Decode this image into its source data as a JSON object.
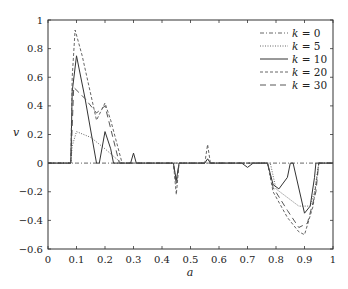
{
  "chart_data": {
    "type": "line",
    "title": "",
    "xlabel": "a",
    "ylabel": "v",
    "xlim": [
      0,
      1
    ],
    "ylim": [
      -0.6,
      1
    ],
    "grid": false,
    "legend_position": "upper right",
    "x_ticks": [
      "0",
      "0.1",
      "0.2",
      "0.3",
      "0.4",
      "0.5",
      "0.6",
      "0.7",
      "0.8",
      "0.9",
      "1"
    ],
    "y_ticks": [
      "-0.6",
      "-0.4",
      "-0.2",
      "0",
      "0.2",
      "0.4",
      "0.6",
      "0.8",
      "1"
    ],
    "series": [
      {
        "name": "k = 0",
        "style": "dashdot",
        "x": [
          0,
          0.08,
          0.09,
          0.1,
          0.5,
          0.9,
          0.95,
          1
        ],
        "y": [
          0,
          0,
          0,
          0,
          0,
          0,
          0,
          0
        ]
      },
      {
        "name": "k = 5",
        "style": "dotted",
        "x": [
          0,
          0.08,
          0.085,
          0.1,
          0.15,
          0.2,
          0.24,
          0.26,
          0.5,
          0.78,
          0.8,
          0.84,
          0.88,
          0.92,
          0.935,
          0.95,
          1
        ],
        "y": [
          0,
          0,
          0.12,
          0.22,
          0.18,
          0.1,
          0.03,
          0,
          0,
          0,
          -0.18,
          -0.24,
          -0.3,
          -0.3,
          -0.2,
          0,
          0
        ]
      },
      {
        "name": "k = 10",
        "style": "solid",
        "x": [
          0,
          0.08,
          0.085,
          0.1,
          0.13,
          0.17,
          0.18,
          0.2,
          0.22,
          0.23,
          0.29,
          0.3,
          0.31,
          0.44,
          0.45,
          0.46,
          0.55,
          0.56,
          0.57,
          0.68,
          0.7,
          0.72,
          0.77,
          0.79,
          0.81,
          0.84,
          0.85,
          0.86,
          0.9,
          0.92,
          0.935,
          0.94,
          1
        ],
        "y": [
          0,
          0,
          0.5,
          0.75,
          0.45,
          0,
          0,
          0.22,
          0.1,
          0,
          0,
          0.07,
          0,
          0,
          -0.12,
          0,
          0,
          0.03,
          0,
          0,
          -0.03,
          0,
          0,
          -0.15,
          -0.18,
          -0.1,
          0,
          0,
          -0.35,
          -0.3,
          -0.1,
          0,
          0
        ]
      },
      {
        "name": "k = 20",
        "style": "dashed",
        "x": [
          0,
          0.08,
          0.085,
          0.095,
          0.12,
          0.17,
          0.2,
          0.22,
          0.26,
          0.44,
          0.45,
          0.46,
          0.55,
          0.56,
          0.57,
          0.77,
          0.79,
          0.84,
          0.88,
          0.9,
          0.93,
          0.95,
          1
        ],
        "y": [
          0,
          0,
          0.6,
          0.93,
          0.75,
          0.3,
          0.42,
          0.3,
          0,
          0,
          -0.22,
          0,
          0,
          0.13,
          0,
          0,
          -0.2,
          -0.38,
          -0.48,
          -0.5,
          -0.3,
          0,
          0
        ]
      },
      {
        "name": "k = 30",
        "style": "longdash",
        "x": [
          0,
          0.08,
          0.09,
          0.13,
          0.17,
          0.2,
          0.25,
          0.44,
          0.45,
          0.46,
          0.77,
          0.79,
          0.84,
          0.88,
          0.91,
          0.94,
          0.95,
          1
        ],
        "y": [
          0,
          0,
          0.53,
          0.45,
          0.35,
          0.4,
          0,
          0,
          -0.15,
          0,
          0,
          -0.17,
          -0.33,
          -0.45,
          -0.42,
          -0.2,
          0,
          0
        ]
      }
    ]
  }
}
